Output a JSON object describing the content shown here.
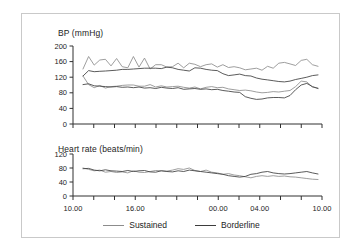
{
  "figure": {
    "border_color": "#c9c9c9",
    "background": "#ffffff"
  },
  "series_colors": {
    "sustained": "#8c8c8c",
    "borderline": "#3d3d3d",
    "axis": "#303030"
  },
  "bp_panel": {
    "title": "BP (mmHg)",
    "y_ticks": [
      "200",
      "160",
      "120",
      "80",
      "40",
      "0"
    ]
  },
  "hr_panel": {
    "title": "Heart rate (beats/min)",
    "y_ticks": [
      "120",
      "80",
      "40",
      "0"
    ]
  },
  "x_axis": {
    "tick_labels": [
      "10.00",
      "16.00",
      "00.00",
      "04.00",
      "10.00"
    ],
    "tick_label_positions": [
      0,
      3,
      7,
      9,
      12
    ],
    "n_ticks": 13
  },
  "legend": {
    "items": [
      {
        "label": "Sustained",
        "color": "#8c8c8c",
        "swatch": "line-swatch"
      },
      {
        "label": "Borderline",
        "color": "#3d3d3d",
        "swatch": "line-swatch"
      }
    ]
  },
  "chart_data": {
    "type": "line",
    "panels": [
      {
        "name": "bp",
        "title": "BP (mmHg)",
        "ylabel": "BP (mmHg)",
        "xlabel": "",
        "ylim": [
          0,
          200
        ],
        "yticks": [
          0,
          40,
          80,
          120,
          160,
          200
        ],
        "grid": false,
        "x": [
          "10.00",
          "11.00",
          "12.00",
          "13.00",
          "14.00",
          "15.00",
          "16.00",
          "17.00",
          "18.00",
          "19.00",
          "20.00",
          "21.00",
          "22.00",
          "23.00",
          "00.00",
          "01.00",
          "02.00",
          "03.00",
          "04.00",
          "05.00",
          "06.00",
          "07.00",
          "08.00",
          "09.00",
          "10.00"
        ],
        "series": [
          {
            "name": "Sustained systolic",
            "group": "Sustained",
            "color": "#8c8c8c",
            "values": [
              141,
              173,
              151,
              164,
              166,
              149,
              168,
              147,
              144,
              173,
              146,
              169,
              141,
              152,
              152,
              146,
              147,
              156,
              144,
              156,
              153,
              147,
              152,
              154,
              146,
              152,
              145,
              147,
              144,
              139,
              141,
              143,
              138,
              148,
              143,
              156,
              158,
              154,
              150,
              163,
              166,
              152,
              148
            ]
          },
          {
            "name": "Borderline systolic",
            "group": "Borderline",
            "color": "#3d3d3d",
            "values": [
              123,
              137,
              134,
              135,
              136,
              137,
              138,
              140,
              140,
              141,
              142,
              143,
              143,
              143,
              142,
              146,
              144,
              140,
              138,
              136,
              144,
              143,
              140,
              138,
              137,
              129,
              124,
              126,
              128,
              124,
              123,
              118,
              115,
              113,
              111,
              109,
              108,
              110,
              114,
              117,
              120,
              124,
              126
            ]
          },
          {
            "name": "Sustained diastolic",
            "group": "Sustained",
            "color": "#8c8c8c",
            "values": [
              123,
              101,
              93,
              99,
              92,
              96,
              97,
              99,
              100,
              100,
              97,
              97,
              101,
              95,
              98,
              95,
              96,
              97,
              94,
              92,
              95,
              90,
              94,
              96,
              93,
              94,
              90,
              88,
              86,
              87,
              85,
              82,
              80,
              81,
              83,
              82,
              84,
              86,
              96,
              110,
              108,
              95,
              92
            ]
          },
          {
            "name": "Borderline diastolic",
            "group": "Borderline",
            "color": "#3d3d3d",
            "values": [
              101,
              103,
              98,
              97,
              96,
              95,
              96,
              94,
              95,
              93,
              95,
              92,
              93,
              91,
              94,
              92,
              91,
              93,
              89,
              90,
              91,
              89,
              90,
              88,
              89,
              86,
              84,
              82,
              81,
              70,
              66,
              63,
              64,
              67,
              68,
              68,
              67,
              73,
              88,
              100,
              104,
              96,
              91
            ]
          }
        ]
      },
      {
        "name": "heart_rate",
        "title": "Heart rate (beats/min)",
        "ylabel": "Heart rate (beats/min)",
        "xlabel": "",
        "ylim": [
          0,
          120
        ],
        "yticks": [
          0,
          40,
          80,
          120
        ],
        "grid": false,
        "x": [
          "10.00",
          "11.00",
          "12.00",
          "13.00",
          "14.00",
          "15.00",
          "16.00",
          "17.00",
          "18.00",
          "19.00",
          "20.00",
          "21.00",
          "22.00",
          "23.00",
          "00.00",
          "01.00",
          "02.00",
          "03.00",
          "04.00",
          "05.00",
          "06.00",
          "07.00",
          "08.00",
          "09.00",
          "10.00"
        ],
        "series": [
          {
            "name": "Sustained heart rate",
            "group": "Sustained",
            "color": "#8c8c8c",
            "values": [
              80,
              76,
              72,
              74,
              68,
              70,
              67,
              69,
              66,
              72,
              68,
              67,
              70,
              73,
              72,
              71,
              74,
              78,
              76,
              80,
              73,
              70,
              74,
              68,
              66,
              62,
              64,
              60,
              58,
              55,
              52,
              56,
              58,
              56,
              58,
              56,
              57,
              55,
              54,
              52,
              50,
              48,
              47
            ]
          },
          {
            "name": "Borderline heart rate",
            "group": "Borderline",
            "color": "#3d3d3d",
            "values": [
              78,
              79,
              74,
              72,
              75,
              72,
              71,
              70,
              73,
              70,
              72,
              73,
              69,
              68,
              72,
              70,
              69,
              72,
              70,
              74,
              72,
              70,
              68,
              66,
              64,
              62,
              58,
              56,
              54,
              56,
              62,
              64,
              68,
              70,
              66,
              64,
              63,
              64,
              66,
              68,
              70,
              66,
              63
            ]
          }
        ]
      }
    ]
  }
}
